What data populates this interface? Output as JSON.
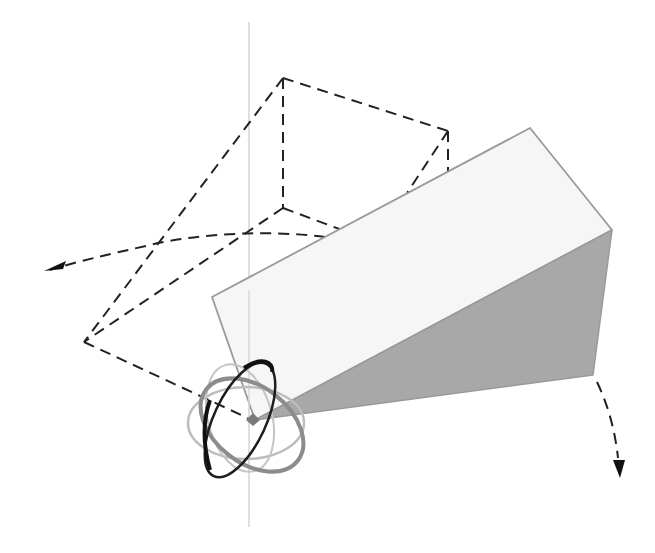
{
  "diagram": {
    "colors": {
      "background": "#ffffff",
      "prism_top_face": "#f6f6f6",
      "prism_side_face": "#a8a8a8",
      "prism_edge": "#9a9a9a",
      "dashed_outline": "#222222",
      "vertical_axis": "#d0d0d0",
      "gizmo_dark_ring": "#1e1e1e",
      "gizmo_mid_ring": "#8a8a8a",
      "gizmo_light_ring": "#b8b8b8",
      "pivot_marker": "#7a7a7a"
    },
    "pivot": {
      "x": 253,
      "y": 420
    },
    "vertical_axis": {
      "x": 249,
      "y1": 22,
      "y2": 527
    },
    "prism": {
      "top_face": [
        [
          212,
          297
        ],
        [
          530,
          128
        ],
        [
          612,
          230
        ],
        [
          255,
          420
        ]
      ],
      "side_face": [
        [
          255,
          420
        ],
        [
          612,
          230
        ],
        [
          593,
          375
        ]
      ]
    },
    "dashed_outline": {
      "vertices": {
        "top_apex": [
          283,
          78
        ],
        "right_top": [
          448,
          131
        ],
        "inner_corner": [
          283,
          208
        ],
        "left": [
          84,
          342
        ],
        "pivot": [
          252,
          420
        ]
      }
    },
    "arrows": [
      {
        "name": "left-rotation-arrow",
        "direction": "left"
      },
      {
        "name": "down-rotation-arrow",
        "direction": "down"
      }
    ]
  }
}
